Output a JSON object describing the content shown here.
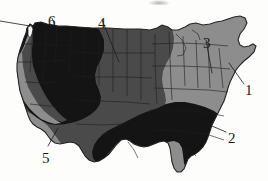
{
  "figure": {
    "background_color": "#fdfdfc"
  },
  "legend_shades": {
    "darkest": "#141414",
    "medium": "#4a4a4a",
    "light": "#8d8d8d",
    "border_color": "#1a1a1a",
    "outline_color": "#2a2a2a"
  },
  "callouts": [
    {
      "id": "callout-1",
      "label": "1",
      "label_x": 245,
      "label_y": 83,
      "leader": {
        "x1": 244,
        "y1": 84,
        "x2": 229,
        "y2": 63
      },
      "points_to": "northeast-coast",
      "region_shade": "light"
    },
    {
      "id": "callout-2",
      "label": "2",
      "label_x": 228,
      "label_y": 131,
      "leader": {
        "x1": 226,
        "y1": 132,
        "x2": 212,
        "y2": 126
      },
      "points_to": "southeast",
      "region_shade": "darkest"
    },
    {
      "id": "callout-3",
      "label": "3",
      "label_x": 203,
      "label_y": 36,
      "leader": {
        "x1": 206,
        "y1": 40,
        "x2": 212,
        "y2": 73
      },
      "points_to": "ohio-valley",
      "region_shade": "light"
    },
    {
      "id": "callout-4",
      "label": "4",
      "label_x": 98,
      "label_y": 16,
      "leader": {
        "x1": 102,
        "y1": 20,
        "x2": 119,
        "y2": 62
      },
      "points_to": "northern-great-plains",
      "region_shade": "medium"
    },
    {
      "id": "callout-5",
      "label": "5",
      "label_x": 42,
      "label_y": 151,
      "leader": {
        "x1": 48,
        "y1": 146,
        "x2": 58,
        "y2": 128
      },
      "points_to": "southwest",
      "region_shade": "medium"
    },
    {
      "id": "callout-6",
      "label": "6",
      "label_x": 48,
      "label_y": 14,
      "leader": {
        "x1": 52,
        "y1": 18,
        "x2": 56,
        "y2": 28
      },
      "points_to": "pacific-northwest",
      "region_shade": "darkest"
    }
  ],
  "edge_pointer": {
    "id": "edge-leader",
    "description": "leader line entering from the left edge toward the Washington coast",
    "x1": 0,
    "y1": 21,
    "x2": 30,
    "y2": 26
  }
}
